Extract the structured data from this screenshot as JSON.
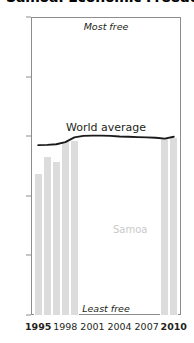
{
  "chart": {
    "title": "Samoa: Economic Freedom",
    "annotations": {
      "most_free": "Most free",
      "least_free": "Least free",
      "world_average": "World average",
      "series_label": "Samoa"
    }
  },
  "chart_data": {
    "type": "bar",
    "title": "Samoa: Economic Freedom",
    "xlabel": "",
    "ylabel": "",
    "xlim": [
      1994.2,
      2010.8
    ],
    "ylim": [
      0,
      100
    ],
    "grid": false,
    "legend": "none",
    "x_ticks": [
      1995,
      1998,
      2001,
      2004,
      2007,
      2010
    ],
    "x_tick_labels": [
      "1995",
      "1998",
      "2001",
      "2004",
      "2007",
      "2010"
    ],
    "x_tick_bold": [
      true,
      false,
      false,
      false,
      false,
      true
    ],
    "y_ticks": [
      0,
      20,
      40,
      60,
      80,
      100
    ],
    "y_tick_labels": [
      "0",
      "20",
      "40",
      "60",
      "80",
      "100"
    ],
    "bar_color": "#dcdcdc",
    "line_color": "#1a1a1a",
    "series": [
      {
        "name": "Samoa",
        "type": "bar",
        "x": [
          1995,
          1996,
          1997,
          1998,
          1999,
          2009,
          2010
        ],
        "values": [
          47.2,
          53.0,
          51.3,
          58.2,
          58.3,
          59.3,
          59.4
        ]
      },
      {
        "name": "World average",
        "type": "line",
        "x": [
          1995,
          1996,
          1997,
          1998,
          1999,
          2000,
          2001,
          2002,
          2003,
          2004,
          2005,
          2006,
          2007,
          2008,
          2009,
          2010
        ],
        "values": [
          57.0,
          57.1,
          57.3,
          58.0,
          59.6,
          60.1,
          60.2,
          60.2,
          60.1,
          59.9,
          59.8,
          59.7,
          59.6,
          59.5,
          59.2,
          59.8
        ]
      }
    ]
  }
}
